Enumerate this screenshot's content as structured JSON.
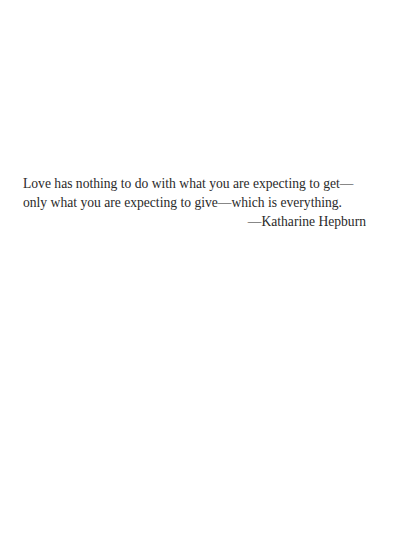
{
  "quote": {
    "lines": [
      "Love has nothing to do with what you are expecting to get—",
      "only what you are expecting to give—which is everything."
    ],
    "attribution": "—Katharine Hepburn"
  }
}
